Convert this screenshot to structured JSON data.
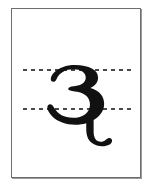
{
  "page": {
    "background_color": "#ffffff"
  },
  "sheet": {
    "name": "specimen card",
    "fill_color": "#ffffff",
    "border_color": "#6e6e6e",
    "shadow_color": "#9a9a9a"
  },
  "guides": {
    "style": "dotted",
    "dot_color": "#4a4a4a",
    "dot_spacing_px": 8,
    "lines": [
      {
        "id": "x-height-line",
        "label": "top guide"
      },
      {
        "id": "baseline",
        "label": "bottom guide"
      }
    ]
  },
  "glyph": {
    "character": "ɛ",
    "name": "latin-small-letter-open-e",
    "alt_name": "greek small letter epsilon",
    "color": "#111111",
    "has_descender": true
  }
}
